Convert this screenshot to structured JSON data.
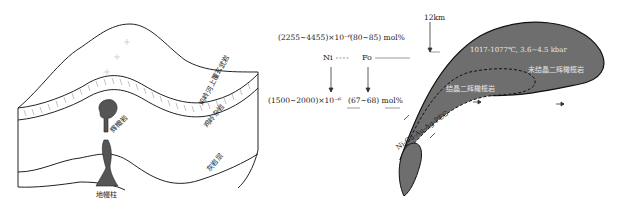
{
  "left_diagram": {
    "layers": {
      "top_basalt": "鸡岭河上覆玄武岩",
      "middle_basalt": "鸡岭杂岩",
      "lower": "灰岩层"
    },
    "intrusion_upper": "辉橄岩",
    "intrusion_lower": "地幔柱"
  },
  "right_diagram": {
    "depth_label": "12km",
    "top_ni": "(2255~4455)×10⁻⁶",
    "top_fo": "(80~85) mol%",
    "ni_label": "Ni",
    "fo_label": "Fo",
    "bottom_ni": "(1500~2000)×10⁻⁶",
    "bottom_fo": "(67~68) mol%",
    "conditions": "1017-1077℃, 3.6~4.5 kbar",
    "outer_chamber": "未结晶二辉橄榄岩",
    "inner_chamber": "结晶二辉橄榄岩",
    "ore_label": "Ni-Cu-Au-Ag-PEG"
  },
  "colors": {
    "magma_fill": "#6e6e6e",
    "outline": "#111111",
    "text": "#222222",
    "magma_text": "#e8e8e8"
  }
}
